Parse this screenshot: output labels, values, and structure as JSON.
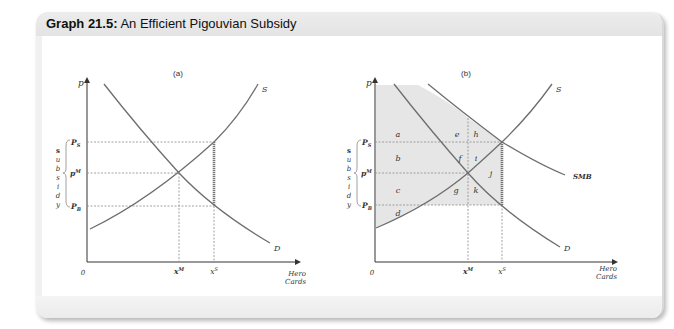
{
  "figure": {
    "title_prefix": "Graph 21.5:",
    "title_text": "An Efficient Pigouvian Subsidy"
  },
  "panels": [
    {
      "id": "a",
      "label": "(a)",
      "y_axis_label": "p",
      "x_axis_label_line1": "Hero",
      "x_axis_label_line2": "Cards",
      "origin_label": "0",
      "price_labels": {
        "ps": "P",
        "ps_sub": "S",
        "pm": "p",
        "pm_sup": "M",
        "pb": "P",
        "pb_sub": "B"
      },
      "quantity_labels": {
        "xm": "x",
        "xm_sup": "M",
        "xs": "x",
        "xs_sup": "S"
      },
      "curve_labels": {
        "supply": "S",
        "demand": "D"
      },
      "bracket_label": [
        "s",
        "u",
        "b",
        "s",
        "i",
        "d",
        "y"
      ]
    },
    {
      "id": "b",
      "label": "(b)",
      "y_axis_label": "p",
      "x_axis_label_line1": "Hero",
      "x_axis_label_line2": "Cards",
      "origin_label": "0",
      "price_labels": {
        "ps": "P",
        "ps_sub": "S",
        "pm": "p",
        "pm_sup": "M",
        "pb": "P",
        "pb_sub": "B"
      },
      "quantity_labels": {
        "xm": "x",
        "xm_sup": "M",
        "xs": "x",
        "xs_sup": "S"
      },
      "curve_labels": {
        "supply": "S",
        "demand": "D",
        "smb": "SMB"
      },
      "bracket_label": [
        "s",
        "u",
        "b",
        "s",
        "i",
        "d",
        "y"
      ],
      "area_labels": [
        "a",
        "b",
        "c",
        "d",
        "e",
        "f",
        "g",
        "h",
        "i",
        "j",
        "k"
      ]
    }
  ],
  "colors": {
    "curve": "#6e6e6e",
    "axis": "#333333",
    "guide": "#8a8a8a",
    "shade": "#e6e6e6",
    "subsidy_text": "#888888"
  }
}
